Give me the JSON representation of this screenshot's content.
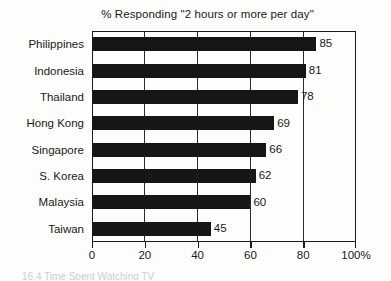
{
  "chart_data": {
    "type": "bar",
    "orientation": "horizontal",
    "title": "% Responding \"2 hours or more per day\"",
    "xlabel": "",
    "ylabel": "",
    "categories": [
      "Philippines",
      "Indonesia",
      "Thailand",
      "Hong Kong",
      "Singapore",
      "S. Korea",
      "Malaysia",
      "Taiwan"
    ],
    "values": [
      85,
      81,
      78,
      69,
      66,
      62,
      60,
      45
    ],
    "value_labels": [
      "85",
      "81",
      "78",
      "69",
      "66",
      "62",
      "60",
      "45"
    ],
    "xlim": [
      0,
      100
    ],
    "xticks": [
      0,
      20,
      40,
      60,
      80,
      100
    ],
    "xtick_labels": [
      "0",
      "20",
      "40",
      "60",
      "80",
      "100%"
    ],
    "grid": true,
    "gridlines_at": [
      20,
      40,
      60,
      80
    ],
    "legend": null,
    "bar_color": "#161616",
    "axis_color": "#1a1a1a",
    "background_color": "#fdfdfb"
  },
  "caption": {
    "text": "16.4  Time Spent Watching TV"
  }
}
